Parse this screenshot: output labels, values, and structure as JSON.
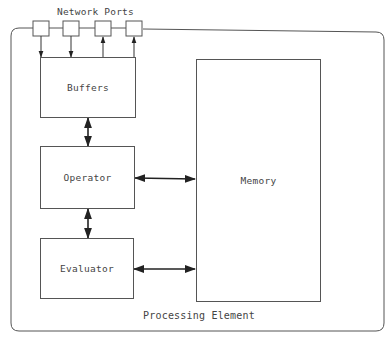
{
  "diagram": {
    "title": "Processing Element",
    "network_ports_label": "Network Ports",
    "ports": [
      {
        "id": "port-1",
        "direction": "in"
      },
      {
        "id": "port-2",
        "direction": "in"
      },
      {
        "id": "port-3",
        "direction": "out"
      },
      {
        "id": "port-4",
        "direction": "out"
      }
    ],
    "blocks": {
      "buffers": "Buffers",
      "operator": "Operator",
      "evaluator": "Evaluator",
      "memory": "Memory"
    },
    "connections": [
      {
        "from": "Network Ports",
        "to": "Buffers",
        "type": "two inputs, two outputs"
      },
      {
        "from": "Buffers",
        "to": "Operator",
        "type": "bidirectional"
      },
      {
        "from": "Operator",
        "to": "Evaluator",
        "type": "bidirectional"
      },
      {
        "from": "Operator",
        "to": "Memory",
        "type": "bidirectional"
      },
      {
        "from": "Evaluator",
        "to": "Memory",
        "type": "bidirectional"
      }
    ],
    "colors": {
      "line": "#555555",
      "text": "#444444",
      "background": "#ffffff"
    }
  }
}
